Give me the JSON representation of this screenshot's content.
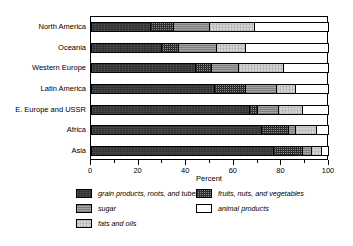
{
  "chart_data": {
    "type": "bar",
    "orientation": "horizontal",
    "stacked": true,
    "stack_mode": "percent",
    "title": "",
    "xlabel": "Percent",
    "ylabel": "",
    "xlim": [
      0,
      100
    ],
    "grid": false,
    "legend_position": "bottom",
    "categories": [
      "North America",
      "Oceania",
      "Western Europe",
      "Latin America",
      "E. Europe and USSR",
      "Africa",
      "Asia"
    ],
    "series": [
      {
        "name": "grain products, roots, and tubers",
        "pattern": "dark-solid",
        "color": "#3a3a3a",
        "values": [
          25,
          30,
          44,
          52,
          67,
          72,
          77
        ]
      },
      {
        "name": "fruits, nuts, and vegetables",
        "pattern": "checker",
        "color": "#8e8e8e",
        "values": [
          10,
          7,
          7,
          13,
          3,
          11,
          12
        ]
      },
      {
        "name": "sugar",
        "pattern": "medium-gray",
        "color": "#9a9a9a",
        "values": [
          15,
          16,
          11,
          13,
          9,
          3,
          4
        ]
      },
      {
        "name": "fats and oils",
        "pattern": "light-gray",
        "color": "#d4d4d4",
        "values": [
          19,
          12,
          19,
          8,
          10,
          9,
          4
        ]
      },
      {
        "name": "animal products",
        "pattern": "white",
        "color": "#ffffff",
        "values": [
          31,
          35,
          19,
          14,
          11,
          5,
          3
        ]
      }
    ],
    "x_ticks_major": [
      0,
      20,
      40,
      60,
      80,
      100
    ],
    "x_ticks_minor": [
      10,
      30,
      50,
      70,
      90
    ],
    "x_tick_labels": [
      "0",
      "20",
      "40",
      "60",
      "80",
      "100"
    ]
  },
  "legend": {
    "items": [
      {
        "label": "grain products, roots, and tubers",
        "swatch": "fill-grain",
        "col": 0,
        "row": 0
      },
      {
        "label": "sugar",
        "swatch": "fill-sugar",
        "col": 0,
        "row": 1
      },
      {
        "label": "fats and oils",
        "swatch": "fill-fats",
        "col": 0,
        "row": 2
      },
      {
        "label": "fruits, nuts, and vegetables",
        "swatch": "fill-fruits",
        "col": 1,
        "row": 0
      },
      {
        "label": "animal products",
        "swatch": "fill-animal",
        "col": 1,
        "row": 1
      }
    ]
  }
}
